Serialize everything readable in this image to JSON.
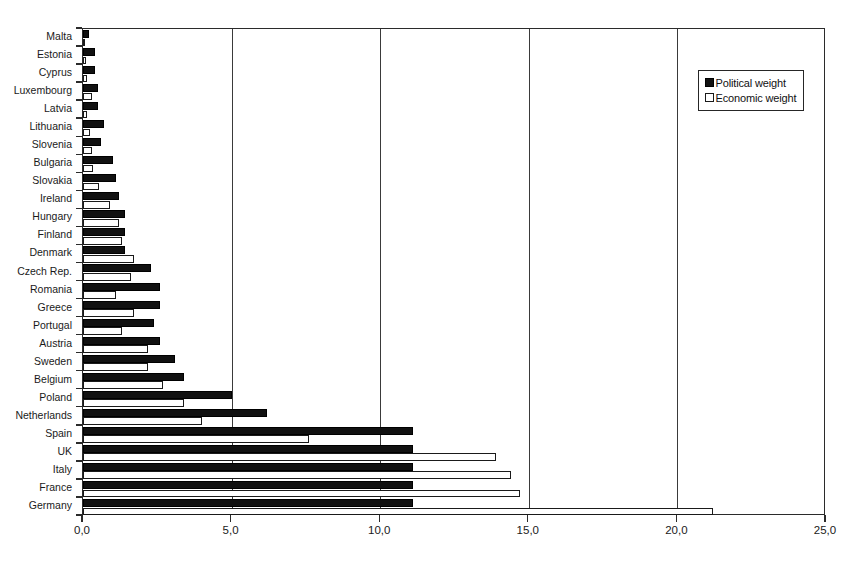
{
  "chart_data": {
    "type": "bar",
    "orientation": "horizontal",
    "title": "",
    "subtitle": "",
    "xlabel": "",
    "ylabel": "",
    "xlim": [
      0,
      25
    ],
    "xticks": [
      0,
      5,
      10,
      15,
      20,
      25
    ],
    "xtick_labels": [
      "0,0",
      "5,0",
      "10,0",
      "15,0",
      "20,0",
      "25,0"
    ],
    "grid": "vertical",
    "legend_position": "top-right",
    "categories": [
      "Malta",
      "Estonia",
      "Cyprus",
      "Luxembourg",
      "Latvia",
      "Lithuania",
      "Slovenia",
      "Bulgaria",
      "Slovakia",
      "Ireland",
      "Hungary",
      "Finland",
      "Denmark",
      "Czech Rep.",
      "Romania",
      "Greece",
      "Portugal",
      "Austria",
      "Sweden",
      "Belgium",
      "Poland",
      "Netherlands",
      "Spain",
      "UK",
      "Italy",
      "France",
      "Germany"
    ],
    "series": [
      {
        "name": "Political weight",
        "color": "#111111",
        "values": [
          0.2,
          0.4,
          0.4,
          0.5,
          0.5,
          0.7,
          0.6,
          1.0,
          1.1,
          1.2,
          1.4,
          1.4,
          1.4,
          2.3,
          2.6,
          2.6,
          2.4,
          2.6,
          3.1,
          3.4,
          5.0,
          6.2,
          11.1,
          11.1,
          11.1,
          11.1,
          11.1
        ]
      },
      {
        "name": "Economic weight",
        "color": "#ffffff",
        "values": [
          0.05,
          0.1,
          0.15,
          0.3,
          0.15,
          0.25,
          0.3,
          0.35,
          0.55,
          0.9,
          1.2,
          1.3,
          1.7,
          1.6,
          1.1,
          1.7,
          1.3,
          2.2,
          2.2,
          2.7,
          3.4,
          4.0,
          7.6,
          13.9,
          14.4,
          14.7,
          21.2
        ]
      }
    ],
    "legend": [
      {
        "label": "Political weight",
        "swatch": "filled-square"
      },
      {
        "label": "Economic weight",
        "swatch": "hollow-square"
      }
    ]
  }
}
